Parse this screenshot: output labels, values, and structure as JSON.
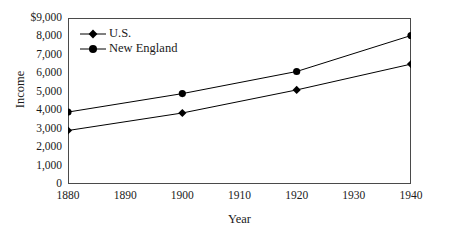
{
  "chart_data": {
    "type": "line",
    "title": "",
    "xlabel": "Year",
    "ylabel": "Income",
    "x": [
      1880,
      1900,
      1920,
      1940
    ],
    "xlim": [
      1880,
      1940
    ],
    "ylim": [
      0,
      9000
    ],
    "xticks": [
      1880,
      1890,
      1900,
      1910,
      1920,
      1930,
      1940
    ],
    "xtick_labels": [
      "1880",
      "1890",
      "1900",
      "1910",
      "1920",
      "1930",
      "1940"
    ],
    "yticks": [
      0,
      1000,
      2000,
      3000,
      4000,
      5000,
      6000,
      7000,
      8000,
      9000
    ],
    "ytick_labels": [
      "0",
      "1,000",
      "2,000",
      "3,000",
      "4,000",
      "5,000",
      "6,000",
      "7,000",
      "8,000",
      "$9,000"
    ],
    "grid": false,
    "legend_position": "top-left",
    "series": [
      {
        "name": "U.S.",
        "marker": "diamond",
        "color": "#000000",
        "values": [
          2900,
          3850,
          5100,
          6500
        ]
      },
      {
        "name": "New England",
        "marker": "circle",
        "color": "#000000",
        "values": [
          3900,
          4900,
          6100,
          8050
        ]
      }
    ]
  }
}
